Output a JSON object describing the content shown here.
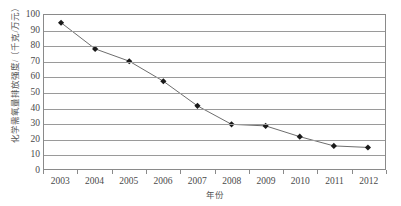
{
  "chart_data": {
    "type": "line",
    "title": "",
    "subtitle": "",
    "xlabel": "年份",
    "ylabel": "化学需氧量排放强度/（千克/万元）",
    "categories": [
      "2003",
      "2004",
      "2005",
      "2006",
      "2007",
      "2008",
      "2009",
      "2010",
      "2011",
      "2012"
    ],
    "x": [
      2003,
      2004,
      2005,
      2006,
      2007,
      2008,
      2009,
      2010,
      2011,
      2012
    ],
    "values": [
      95,
      78,
      70,
      57,
      41,
      29,
      28,
      21,
      15,
      14
    ],
    "series": [
      {
        "name": "化学需氧量排放强度",
        "values": [
          95,
          78,
          70,
          57,
          41,
          29,
          28,
          21,
          15,
          14
        ]
      }
    ],
    "yticks": [
      0,
      10,
      20,
      30,
      40,
      50,
      60,
      70,
      80,
      90,
      100
    ],
    "ytick_labels": [
      "0",
      "10",
      "20",
      "30",
      "40",
      "50",
      "60",
      "70",
      "80",
      "90",
      "100"
    ],
    "ylim": [
      0,
      100
    ],
    "grid": "horizontal",
    "legend": "none",
    "marker": "diamond",
    "line_color": "#6b6b6b",
    "marker_color": "#1a1a1a",
    "grid_color": "#9a9a9a",
    "axis_color": "#8a8a8a",
    "background_color": "#ffffff"
  }
}
